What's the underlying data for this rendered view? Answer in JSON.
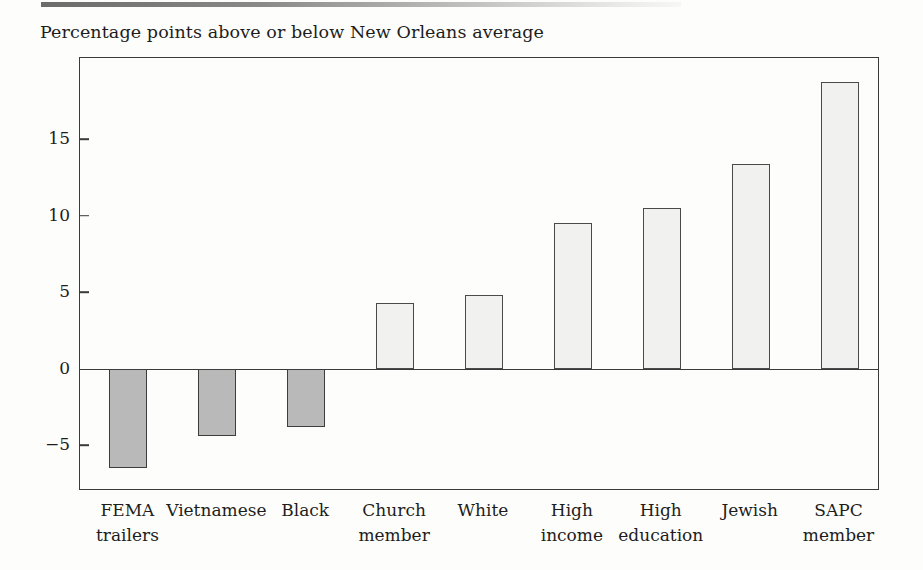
{
  "caption": "Percentage points above or below New Orleans average",
  "chart_data": {
    "type": "bar",
    "title": "",
    "subtitle": "Percentage points above or below New Orleans average",
    "xlabel": "",
    "ylabel": "Percentage points above or below New Orleans average",
    "categories": [
      "FEMA trailers",
      "Vietnamese",
      "Black",
      "Church member",
      "White",
      "High income",
      "High education",
      "Jewish",
      "SAPC member"
    ],
    "category_lines": [
      [
        "FEMA",
        "trailers"
      ],
      [
        "Vietnamese",
        ""
      ],
      [
        "Black",
        ""
      ],
      [
        "Church",
        "member"
      ],
      [
        "White",
        ""
      ],
      [
        "High",
        "income"
      ],
      [
        "High",
        "education"
      ],
      [
        "Jewish",
        ""
      ],
      [
        "SAPC",
        "member"
      ]
    ],
    "values": [
      -6.5,
      -4.4,
      -3.8,
      4.3,
      4.8,
      9.5,
      10.5,
      13.4,
      18.7
    ],
    "ylim": [
      -8.0,
      20.3
    ],
    "yticks": [
      15,
      10,
      5,
      0,
      -5
    ],
    "ytick_labels": [
      "15",
      "10",
      "5",
      "0",
      "−5"
    ],
    "grid": false,
    "legend": "none",
    "bar_colors": {
      "positive_fill": "#f1f1ef",
      "negative_fill": "#b9b9b9",
      "outline": "#4a4a4a"
    },
    "zero_reference": 0
  }
}
